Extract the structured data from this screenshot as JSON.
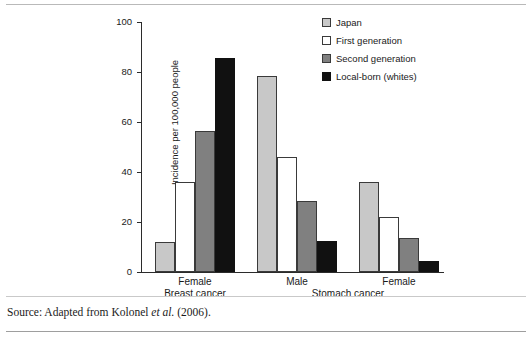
{
  "chart_data": {
    "type": "bar",
    "title": "",
    "xlabel": "",
    "ylabel": "Incidence per 100,000 people",
    "ylim": [
      0,
      100
    ],
    "yticks": [
      0,
      20,
      40,
      60,
      80,
      100
    ],
    "grid": false,
    "legend_position": "top-right",
    "categories": [
      "Female",
      "Male",
      "Female"
    ],
    "category_groups": [
      {
        "label": "Breast cancer",
        "categories": [
          "Female"
        ]
      },
      {
        "label": "Stomach cancer",
        "categories": [
          "Male",
          "Female"
        ]
      }
    ],
    "series": [
      {
        "name": "Japan",
        "color": "#c8c8c8",
        "values": [
          12,
          78.5,
          36
        ]
      },
      {
        "name": "First generation",
        "color": "#ffffff",
        "values": [
          36,
          46,
          22
        ]
      },
      {
        "name": "Second generation",
        "color": "#808080",
        "values": [
          56.5,
          28.5,
          13.5
        ]
      },
      {
        "name": "Local-born (whites)",
        "color": "#111111",
        "values": [
          85.5,
          12.5,
          4.5
        ]
      }
    ]
  },
  "axis": {
    "y_label": "Incidence per 100,000 people",
    "y_ticks": [
      "0",
      "20",
      "40",
      "60",
      "80",
      "100"
    ]
  },
  "legend": {
    "items": [
      {
        "label": "Japan",
        "color": "#c8c8c8"
      },
      {
        "label": "First generation",
        "color": "#ffffff"
      },
      {
        "label": "Second generation",
        "color": "#808080"
      },
      {
        "label": "Local-born (whites)",
        "color": "#111111"
      }
    ]
  },
  "x_axis_labels": {
    "tick_labels": [
      "Female",
      "Male",
      "Female"
    ],
    "group_labels": [
      "Breast cancer",
      "Stomach cancer"
    ]
  },
  "source": {
    "prefix": "Source: Adapted from Kolonel ",
    "italic": "et al.",
    "suffix": " (2006)."
  }
}
